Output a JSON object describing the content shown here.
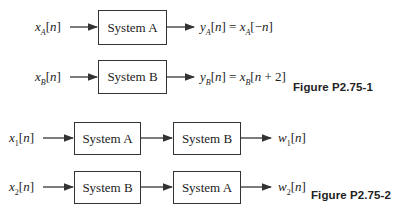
{
  "figure1": {
    "caption": "Figure P2.75-1",
    "rows": [
      {
        "input": "x_A[n]",
        "box": "System A",
        "output": "y_A[n] = x_A[−n]"
      },
      {
        "input": "x_B[n]",
        "box": "System B",
        "output": "y_B[n] = x_B[n + 2]"
      }
    ]
  },
  "figure2": {
    "caption": "Figure P2.75-2",
    "rows": [
      {
        "input": "x_1[n]",
        "boxes": [
          "System A",
          "System B"
        ],
        "output": "w_1[n]"
      },
      {
        "input": "x_2[n]",
        "boxes": [
          "System B",
          "System A"
        ],
        "output": "w_2[n]"
      }
    ]
  },
  "labels": {
    "sysA": "System A",
    "sysB": "System B",
    "fig1": "Figure P2.75-1",
    "fig2": "Figure P2.75-2"
  }
}
